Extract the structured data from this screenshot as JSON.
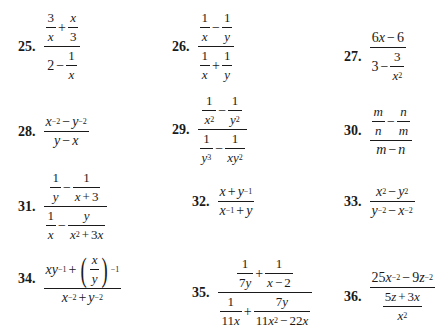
{
  "problems": [
    {
      "number": "25.",
      "expression": "(3/x + x/3) / (2 - 1/x)"
    },
    {
      "number": "26.",
      "expression": "(1/x - 1/y) / (1/x + 1/y)"
    },
    {
      "number": "27.",
      "expression": "(6x - 6) / (3 - 3/x^2)"
    },
    {
      "number": "28.",
      "expression": "(x^-2 - y^-2) / (y - x)"
    },
    {
      "number": "29.",
      "expression": "(1/x^2 - 1/y^2) / (1/y^3 - 1/(xy^2))"
    },
    {
      "number": "30.",
      "expression": "(m/n - n/m) / (m - n)"
    },
    {
      "number": "31.",
      "expression": "(1/y - 1/(x+3)) / (1/x - y/(x^2+3x))"
    },
    {
      "number": "32.",
      "expression": "(x + y^-1) / (x^-1 + y)"
    },
    {
      "number": "33.",
      "expression": "(x^2 - y^2) / (y^-2 - x^-2)"
    },
    {
      "number": "34.",
      "expression": "(xy^-1 + (x/y)^-1) / (x^-2 + y^-2)"
    },
    {
      "number": "35.",
      "expression": "(1/(7y) + 1/(x-2)) / (1/(11x) + 7y/(11x^2 - 22x))"
    },
    {
      "number": "36.",
      "expression": "(25x^-2 - 9z^-2) / ((5z + 3x)/x^2)"
    }
  ],
  "t": {
    "one": "1",
    "two": "2",
    "three": "3",
    "six": "6",
    "seven": "7",
    "eleven": "11",
    "tf": "25",
    "nine": "9",
    "twentytwo": "22",
    "x": "x",
    "y": "y",
    "m": "m",
    "n": "n",
    "z": "z",
    "plus": "+",
    "minus": "−",
    "sq": "2",
    "neg1": "−1",
    "neg2": "−2",
    "cube": "3",
    "lparen": "(",
    "rparen": ")"
  }
}
